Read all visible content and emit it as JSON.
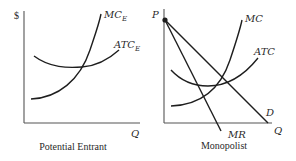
{
  "diagram": {
    "panels": [
      {
        "id": "potential-entrant",
        "caption": "Potential Entrant",
        "y_axis_label": "$",
        "x_axis_label": "Q",
        "curves": [
          {
            "name": "marginal-cost",
            "label": "MC",
            "subscript": "E"
          },
          {
            "name": "average-total-cost",
            "label": "ATC",
            "subscript": "E"
          }
        ]
      },
      {
        "id": "monopolist",
        "caption": "Monopolist",
        "y_axis_label": "P",
        "x_axis_label": "Q",
        "curves": [
          {
            "name": "marginal-cost",
            "label": "MC"
          },
          {
            "name": "average-total-cost",
            "label": "ATC"
          },
          {
            "name": "demand",
            "label": "D"
          },
          {
            "name": "marginal-revenue",
            "label": "MR"
          }
        ],
        "point": {
          "name": "price-intercept",
          "description": "dot at top of P axis where D and MR originate"
        }
      }
    ],
    "colors": {
      "line": "#1e1e1e",
      "axis": "#555555",
      "text": "#2a2a2a",
      "background": "#ffffff"
    }
  }
}
